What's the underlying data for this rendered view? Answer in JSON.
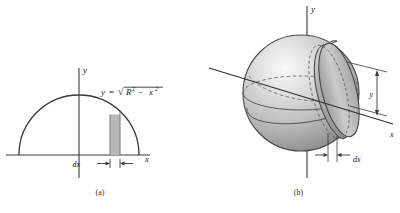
{
  "figure": {
    "panels": [
      {
        "id": "a",
        "caption": "(a)",
        "type": "2d-semicircle-with-strip",
        "axis_y_label": "y",
        "axis_x_label": "x",
        "curve_equation": {
          "lhs": "y",
          "equals": "=",
          "radical": "√",
          "radicand_base_1": "R",
          "radicand_exp_1": "2",
          "minus": "−",
          "radicand_base_2": "x",
          "radicand_exp_2": "2",
          "plain": "y = √(R² − x²)"
        },
        "strip_label": "dx"
      },
      {
        "id": "b",
        "caption": "(b)",
        "type": "3d-sphere-with-disk-element",
        "axis_y_label": "y",
        "axis_x_label": "x",
        "height_label": "y",
        "thickness_label": "dx"
      }
    ]
  },
  "colors": {
    "background": "#ffffff",
    "stroke": "#3a3a3a",
    "stroke_light": "#6f6f6f",
    "strip_fill": "#b9b9b9",
    "strip_edge": "#7b7b7b",
    "sphere_light": "#f2f2f2",
    "sphere_mid": "#c9c9c9",
    "sphere_dark": "#8e8e8e",
    "sphere_edge": "#4a4a4a",
    "disk_fill": "#c4c4c4",
    "dashed": "#5a5a5a"
  }
}
